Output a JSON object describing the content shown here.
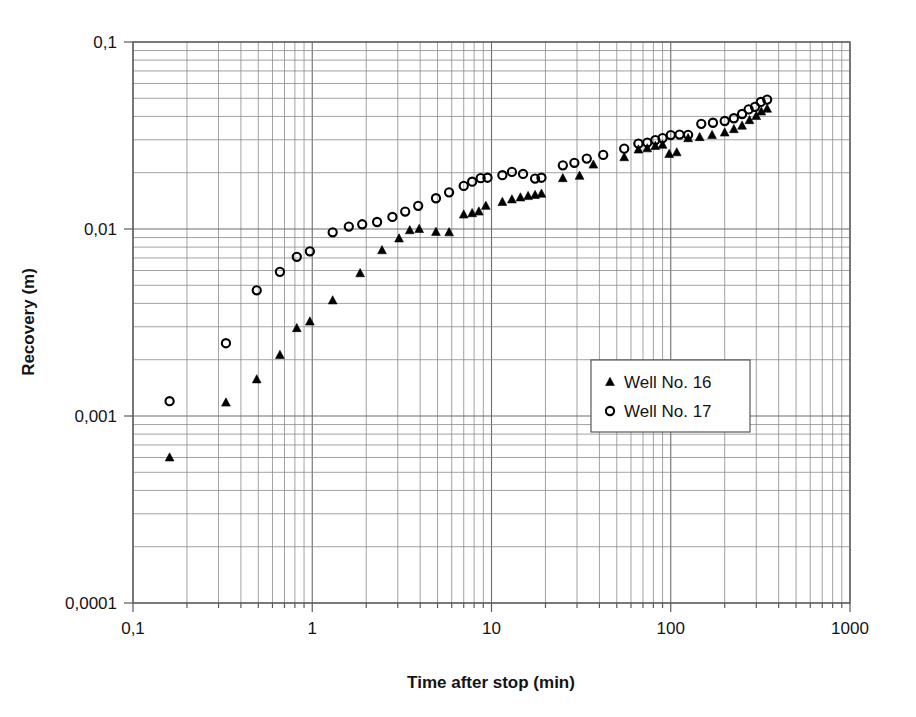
{
  "chart_data": {
    "type": "scatter",
    "title": "",
    "xlabel": "Time after stop (min)",
    "ylabel": "Recovery (m)",
    "xscale": "log",
    "yscale": "log",
    "xlim": [
      0.1,
      1000
    ],
    "ylim": [
      0.0001,
      0.1
    ],
    "xticks": [
      "0,1",
      "1",
      "10",
      "100",
      "1000"
    ],
    "xtick_values": [
      0.1,
      1,
      10,
      100,
      1000
    ],
    "yticks": [
      "0,1",
      "0,01",
      "0,001",
      "0,0001"
    ],
    "ytick_values": [
      0.1,
      0.01,
      0.001,
      0.0001
    ],
    "grid": "major and minor on both axes",
    "legend_position": "middle right",
    "decimal_separator": "comma",
    "series": [
      {
        "name": "Well No. 16",
        "marker": "triangle",
        "marker_filled": true,
        "color": "#000000",
        "points": [
          [
            0.16,
            0.0006
          ],
          [
            0.33,
            0.00118
          ],
          [
            0.49,
            0.00157
          ],
          [
            0.66,
            0.00212
          ],
          [
            0.82,
            0.00295
          ],
          [
            0.97,
            0.0032
          ],
          [
            1.3,
            0.00415
          ],
          [
            1.85,
            0.0058
          ],
          [
            2.45,
            0.0077
          ],
          [
            3.05,
            0.0089
          ],
          [
            3.5,
            0.00985
          ],
          [
            3.95,
            0.01
          ],
          [
            4.9,
            0.00965
          ],
          [
            5.8,
            0.0096
          ],
          [
            7.0,
            0.01195
          ],
          [
            7.8,
            0.01215
          ],
          [
            8.5,
            0.0124
          ],
          [
            9.3,
            0.0133
          ],
          [
            11.5,
            0.01395
          ],
          [
            13.0,
            0.0144
          ],
          [
            14.5,
            0.01475
          ],
          [
            16.0,
            0.015
          ],
          [
            17.5,
            0.0152
          ],
          [
            19.0,
            0.01545
          ],
          [
            25.0,
            0.0187
          ],
          [
            31.0,
            0.01925
          ],
          [
            37.0,
            0.0221
          ],
          [
            55.0,
            0.0242
          ],
          [
            66.0,
            0.0266
          ],
          [
            74.0,
            0.027
          ],
          [
            82.0,
            0.0278
          ],
          [
            90.0,
            0.0282
          ],
          [
            98.0,
            0.0252
          ],
          [
            108.0,
            0.0257
          ],
          [
            125.0,
            0.0306
          ],
          [
            145.0,
            0.031
          ],
          [
            170.0,
            0.0318
          ],
          [
            200.0,
            0.0328
          ],
          [
            225.0,
            0.0342
          ],
          [
            250.0,
            0.0357
          ],
          [
            275.0,
            0.0382
          ],
          [
            300.0,
            0.0402
          ],
          [
            320.0,
            0.0425
          ],
          [
            345.0,
            0.044
          ]
        ]
      },
      {
        "name": "Well No. 17",
        "marker": "circle",
        "marker_filled": false,
        "color": "#000000",
        "points": [
          [
            0.16,
            0.0012
          ],
          [
            0.33,
            0.00245
          ],
          [
            0.49,
            0.0047
          ],
          [
            0.66,
            0.0059
          ],
          [
            0.82,
            0.0071
          ],
          [
            0.97,
            0.0076
          ],
          [
            1.3,
            0.0096
          ],
          [
            1.6,
            0.0103
          ],
          [
            1.9,
            0.0106
          ],
          [
            2.3,
            0.0109
          ],
          [
            2.8,
            0.0116
          ],
          [
            3.3,
            0.0124
          ],
          [
            3.9,
            0.0133
          ],
          [
            4.9,
            0.0146
          ],
          [
            5.8,
            0.0157
          ],
          [
            7.0,
            0.017
          ],
          [
            7.8,
            0.0179
          ],
          [
            8.7,
            0.0187
          ],
          [
            9.5,
            0.0188
          ],
          [
            11.5,
            0.0194
          ],
          [
            13.0,
            0.0202
          ],
          [
            15.0,
            0.0197
          ],
          [
            17.5,
            0.0186
          ],
          [
            19.0,
            0.0188
          ],
          [
            25.0,
            0.0219
          ],
          [
            29.0,
            0.0226
          ],
          [
            34.0,
            0.0238
          ],
          [
            42.0,
            0.0249
          ],
          [
            55.0,
            0.0269
          ],
          [
            66.0,
            0.0286
          ],
          [
            74.0,
            0.029
          ],
          [
            82.0,
            0.0299
          ],
          [
            90.0,
            0.0306
          ],
          [
            100.0,
            0.0318
          ],
          [
            112.0,
            0.032
          ],
          [
            125.0,
            0.0319
          ],
          [
            148.0,
            0.0365
          ],
          [
            172.0,
            0.037
          ],
          [
            200.0,
            0.0378
          ],
          [
            225.0,
            0.0391
          ],
          [
            250.0,
            0.0412
          ],
          [
            272.0,
            0.0436
          ],
          [
            295.0,
            0.045
          ],
          [
            318.0,
            0.0478
          ],
          [
            345.0,
            0.0492
          ]
        ]
      }
    ]
  },
  "legend": {
    "items": [
      {
        "label": "Well No. 16",
        "marker": "triangle"
      },
      {
        "label": "Well No. 17",
        "marker": "circle"
      }
    ]
  }
}
